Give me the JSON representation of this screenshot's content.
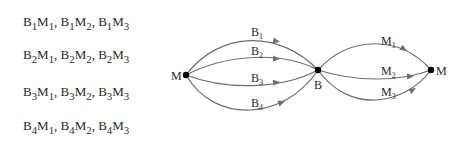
{
  "combinations": [
    {
      "items": [
        {
          "b": "1",
          "m": "1"
        },
        {
          "b": "1",
          "m": "2"
        },
        {
          "b": "1",
          "m": "3"
        }
      ]
    },
    {
      "items": [
        {
          "b": "2",
          "m": "1"
        },
        {
          "b": "2",
          "m": "2"
        },
        {
          "b": "2",
          "m": "3"
        }
      ]
    },
    {
      "items": [
        {
          "b": "3",
          "m": "1"
        },
        {
          "b": "3",
          "m": "2"
        },
        {
          "b": "3",
          "m": "3"
        }
      ]
    },
    {
      "items": [
        {
          "b": "4",
          "m": "1"
        },
        {
          "b": "4",
          "m": "2"
        },
        {
          "b": "4",
          "m": "3"
        }
      ]
    }
  ],
  "diagram": {
    "nodes": {
      "start": {
        "label": "M"
      },
      "middle": {
        "label": "B"
      },
      "end": {
        "label": "M"
      }
    },
    "b_edges": [
      {
        "label": "B",
        "sub": "1"
      },
      {
        "label": "B",
        "sub": "2"
      },
      {
        "label": "B",
        "sub": "3"
      },
      {
        "label": "B",
        "sub": "4"
      }
    ],
    "m_edges": [
      {
        "label": "M",
        "sub": "1"
      },
      {
        "label": "M",
        "sub": "2"
      },
      {
        "label": "M",
        "sub": "3"
      }
    ],
    "colors": {
      "edge": "#6e6e6e",
      "node": "#000000",
      "text": "#2a2a2a"
    }
  }
}
